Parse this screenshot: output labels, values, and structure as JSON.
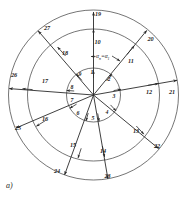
{
  "figure": {
    "caption": "a)",
    "angle_annotation": {
      "symbol1": "α",
      "sub1": "n",
      "operator": "=",
      "symbol2": "α",
      "sub2": "1"
    },
    "geometry": {
      "center_x": 93.5,
      "center_y": 95,
      "inner_radius": 27,
      "middle_radius": 66,
      "outer_radius": 85,
      "spoke_count": 9,
      "start_angle_deg": -90,
      "step_angle_deg": 40
    },
    "colors": {
      "stroke": "#3a3a3a",
      "spoke": "#2a2a2a",
      "text": "#1c1c1c",
      "background": "#ffffff"
    },
    "rings": [
      {
        "name": "inner-ring",
        "labels": [
          "1",
          "2",
          "3",
          "4",
          "5",
          "6",
          "7",
          "8",
          "9"
        ]
      },
      {
        "name": "middle-ring",
        "labels": [
          "10",
          "11",
          "12",
          "13",
          "14",
          "15",
          "16",
          "17",
          "18"
        ]
      },
      {
        "name": "outer-ring",
        "labels": [
          "19",
          "20",
          "21",
          "22",
          "23",
          "24",
          "25",
          "26",
          "27"
        ]
      }
    ]
  }
}
